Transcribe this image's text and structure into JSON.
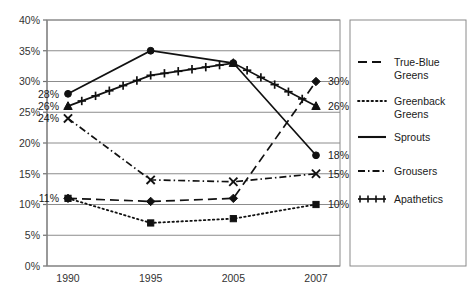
{
  "chart_data": {
    "type": "line",
    "title": "",
    "xlabel": "",
    "ylabel": "",
    "categories": [
      "1990",
      "1995",
      "2005",
      "2007"
    ],
    "ylim": [
      0,
      40
    ],
    "ytick_labels": [
      "0%",
      "5%",
      "10%",
      "15%",
      "20%",
      "25%",
      "30%",
      "35%",
      "40%"
    ],
    "ytick_values": [
      0,
      5,
      10,
      15,
      20,
      25,
      30,
      35,
      40
    ],
    "grid": true,
    "legend_position": "right",
    "series": [
      {
        "name": "True-Blue Greens",
        "values": [
          11,
          10.5,
          11,
          30
        ],
        "line_style": "dashed",
        "marker": "diamond"
      },
      {
        "name": "Greenback Greens",
        "values": [
          11,
          7,
          7.7,
          10
        ],
        "line_style": "dotted",
        "marker": "square"
      },
      {
        "name": "Sprouts",
        "values": [
          28,
          35,
          33,
          18
        ],
        "line_style": "solid",
        "marker": "circle"
      },
      {
        "name": "Grousers",
        "values": [
          24,
          14,
          13.7,
          15
        ],
        "line_style": "dash-dot",
        "marker": "x"
      },
      {
        "name": "Apathetics",
        "values": [
          26,
          31,
          33,
          26
        ],
        "line_style": "solid-plus",
        "marker": "plus"
      }
    ],
    "annotations": [
      {
        "text": "28%",
        "series": "Sprouts",
        "x": "1990",
        "value": 28,
        "side": "left"
      },
      {
        "text": "26%",
        "series": "Apathetics",
        "x": "1990",
        "value": 26,
        "side": "left"
      },
      {
        "text": "24%",
        "series": "Grousers",
        "x": "1990",
        "value": 24,
        "side": "left"
      },
      {
        "text": "11%",
        "series": "True-Blue Greens",
        "x": "1990",
        "value": 11,
        "side": "left"
      },
      {
        "text": "30%",
        "series": "True-Blue Greens",
        "x": "2007",
        "value": 30,
        "side": "right"
      },
      {
        "text": "26%",
        "series": "Apathetics",
        "x": "2007",
        "value": 26,
        "side": "right"
      },
      {
        "text": "18%",
        "series": "Sprouts",
        "x": "2007",
        "value": 18,
        "side": "right"
      },
      {
        "text": "15%",
        "series": "Grousers",
        "x": "2007",
        "value": 15,
        "side": "right"
      },
      {
        "text": "10%",
        "series": "Greenback Greens",
        "x": "2007",
        "value": 10,
        "side": "right"
      }
    ]
  },
  "legend": {
    "items": [
      {
        "label": "True-Blue Greens"
      },
      {
        "label": "Greenback Greens"
      },
      {
        "label": "Sprouts"
      },
      {
        "label": "Grousers"
      },
      {
        "label": "Apathetics"
      }
    ]
  },
  "colors": {
    "series": "#111111",
    "grid": "#8c8c8c",
    "axis": "#6e6e6e",
    "frame": "#8a8a8a",
    "text": "#1a1a1a",
    "background": "#ffffff"
  }
}
